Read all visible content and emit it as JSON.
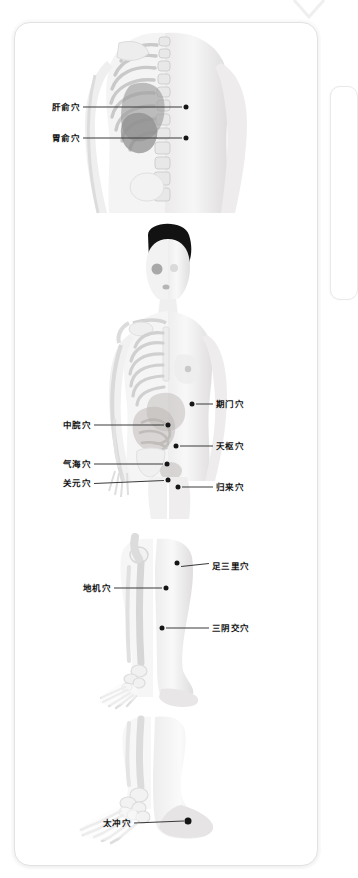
{
  "app": {
    "title": "Acupuncture Point Illustration Card",
    "background_color": "#ffffff",
    "card_color": "#ffffff",
    "card_border_color": "#e2e2e2",
    "label_color": "#131313",
    "point_color": "#151515",
    "leader_color": "#3a3a3a"
  },
  "decorations": {
    "chevron_icon": "chevron-down-icon",
    "adjacent_card_hint": "partial-card-right-edge"
  },
  "panels": [
    {
      "id": "back-torso",
      "name": "back-view-panel",
      "figure": "human-back-with-ribcage-and-spine",
      "points": [
        {
          "label": "肝俞穴",
          "side": "left",
          "label_x": 52,
          "label_y": 107,
          "dot_x": 186,
          "dot_y": 107
        },
        {
          "label": "胃俞穴",
          "side": "left",
          "label_x": 52,
          "label_y": 138,
          "dot_x": 186,
          "dot_y": 138
        }
      ]
    },
    {
      "id": "front-torso",
      "name": "front-view-panel",
      "figure": "human-front-half-skeleton-half-skin",
      "points": [
        {
          "label": "期门穴",
          "side": "right",
          "label_x": 216,
          "label_y": 404,
          "dot_x": 192,
          "dot_y": 404
        },
        {
          "label": "中脘穴",
          "side": "left",
          "label_x": 63,
          "label_y": 425,
          "dot_x": 168,
          "dot_y": 425
        },
        {
          "label": "天枢穴",
          "side": "right",
          "label_x": 216,
          "label_y": 446,
          "dot_x": 176,
          "dot_y": 446
        },
        {
          "label": "气海穴",
          "side": "left",
          "label_x": 63,
          "label_y": 464,
          "dot_x": 167,
          "dot_y": 464
        },
        {
          "label": "关元穴",
          "side": "left",
          "label_x": 63,
          "label_y": 483,
          "dot_x": 168,
          "dot_y": 480
        },
        {
          "label": "归来穴",
          "side": "right",
          "label_x": 216,
          "label_y": 487,
          "dot_x": 178,
          "dot_y": 487
        }
      ]
    },
    {
      "id": "lower-leg",
      "name": "leg-view-panel",
      "figure": "lower-legs-half-skeleton-half-skin",
      "points": [
        {
          "label": "足三里穴",
          "side": "right",
          "label_x": 212,
          "label_y": 566,
          "dot_x": 177,
          "dot_y": 563
        },
        {
          "label": "地机穴",
          "side": "left",
          "label_x": 83,
          "label_y": 588,
          "dot_x": 166,
          "dot_y": 588
        },
        {
          "label": "三阴交穴",
          "side": "right",
          "label_x": 212,
          "label_y": 628,
          "dot_x": 162,
          "dot_y": 628
        }
      ]
    },
    {
      "id": "foot",
      "name": "foot-view-panel",
      "figure": "feet-half-skeleton-half-skin",
      "points": [
        {
          "label": "太冲穴",
          "side": "left",
          "label_x": 103,
          "label_y": 823,
          "dot_x": 188,
          "dot_y": 821
        }
      ]
    }
  ]
}
